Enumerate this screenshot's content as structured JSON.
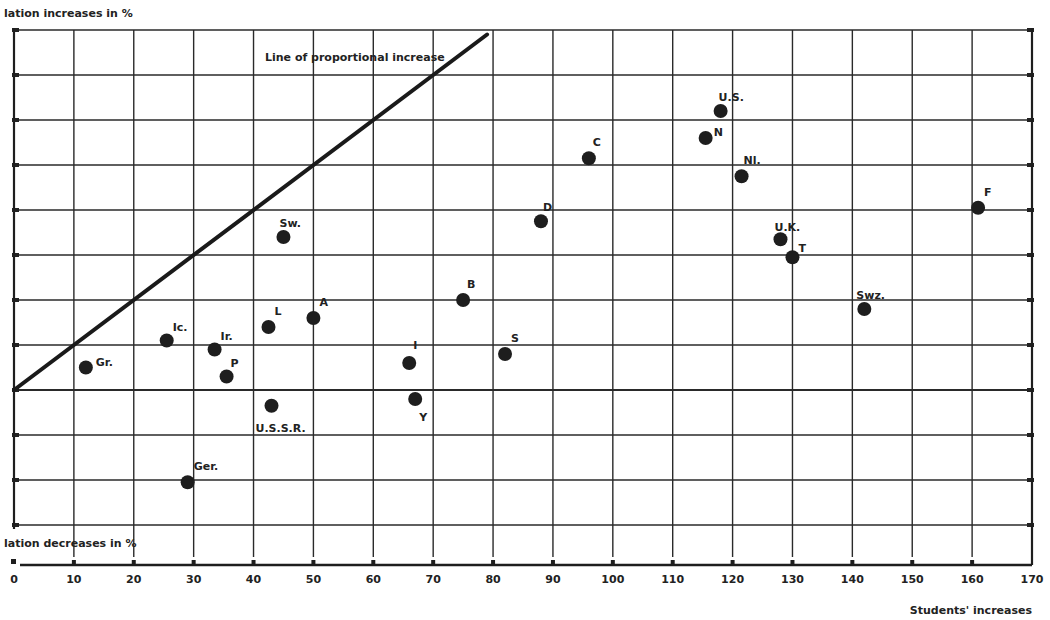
{
  "chart_data": {
    "type": "scatter",
    "title": "",
    "ylabel_top": "lation increases in %",
    "ylabel_bottom": "lation decreases in %",
    "xlabel": "Students' increases",
    "xlim": [
      0,
      170
    ],
    "ylim": [
      -35,
      80
    ],
    "xticks": [
      0,
      10,
      20,
      30,
      40,
      50,
      60,
      70,
      80,
      90,
      100,
      110,
      120,
      130,
      140,
      150,
      160,
      170
    ],
    "yticks": [
      -30,
      -20,
      -10,
      0,
      10,
      20,
      30,
      40,
      50,
      60,
      70,
      80
    ],
    "grid": true,
    "reference_line": {
      "label": "Line of proportional increase",
      "from": [
        0,
        0
      ],
      "to": [
        79,
        79
      ]
    },
    "points": [
      {
        "label": "Gr.",
        "x": 12,
        "y": 5
      },
      {
        "label": "Ic.",
        "x": 25.5,
        "y": 11
      },
      {
        "label": "Ir.",
        "x": 33.5,
        "y": 9
      },
      {
        "label": "P",
        "x": 35.5,
        "y": 3
      },
      {
        "label": "L",
        "x": 42.5,
        "y": 14
      },
      {
        "label": "A",
        "x": 50,
        "y": 16
      },
      {
        "label": "Sw.",
        "x": 45,
        "y": 34
      },
      {
        "label": "U.S.S.R.",
        "x": 43,
        "y": -3.5
      },
      {
        "label": "Ger.",
        "x": 29,
        "y": -20.5
      },
      {
        "label": "I",
        "x": 66,
        "y": 6
      },
      {
        "label": "Y",
        "x": 67,
        "y": -2
      },
      {
        "label": "B",
        "x": 75,
        "y": 20
      },
      {
        "label": "S",
        "x": 82,
        "y": 8
      },
      {
        "label": "D",
        "x": 88,
        "y": 37.5
      },
      {
        "label": "C",
        "x": 96,
        "y": 51.5
      },
      {
        "label": "U.S.",
        "x": 118,
        "y": 62
      },
      {
        "label": "N",
        "x": 115.5,
        "y": 56
      },
      {
        "label": "Nl.",
        "x": 121.5,
        "y": 47.5
      },
      {
        "label": "U.K.",
        "x": 128,
        "y": 33.5
      },
      {
        "label": "T",
        "x": 130,
        "y": 29.5
      },
      {
        "label": "Swz.",
        "x": 142,
        "y": 18
      },
      {
        "label": "F",
        "x": 161,
        "y": 40.5
      }
    ],
    "label_offsets": {
      "Gr.": [
        10,
        -2
      ],
      "Ic.": [
        6,
        -10
      ],
      "Ir.": [
        6,
        -10
      ],
      "P": [
        4,
        -10
      ],
      "L": [
        6,
        -12
      ],
      "A": [
        6,
        -12
      ],
      "Sw.": [
        -4,
        -10
      ],
      "U.S.S.R.": [
        -16,
        26
      ],
      "Ger.": [
        6,
        -12
      ],
      "I": [
        4,
        -14
      ],
      "Y": [
        4,
        22
      ],
      "B": [
        4,
        -12
      ],
      "S": [
        6,
        -12
      ],
      "D": [
        2,
        -10
      ],
      "C": [
        4,
        -12
      ],
      "U.S.": [
        -2,
        -10
      ],
      "N": [
        8,
        -2
      ],
      "Nl.": [
        2,
        -12
      ],
      "U.K.": [
        -6,
        -8
      ],
      "T": [
        6,
        -5
      ],
      "Swz.": [
        -8,
        -10
      ],
      "F": [
        6,
        -12
      ]
    }
  }
}
